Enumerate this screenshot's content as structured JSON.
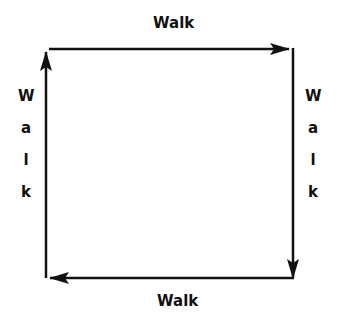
{
  "diagram": {
    "top_label": "Walk",
    "bottom_label": "Walk",
    "left_label": [
      "W",
      "a",
      "l",
      "k"
    ],
    "right_label": [
      "W",
      "a",
      "l",
      "k"
    ],
    "stroke_color": "#111111",
    "background": "#ffffff"
  }
}
